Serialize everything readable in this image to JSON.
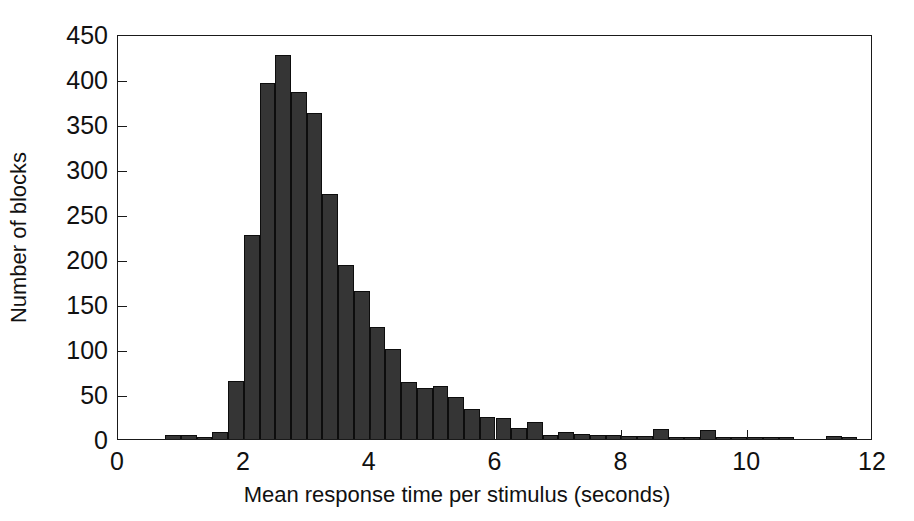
{
  "chart_data": {
    "type": "bar",
    "title": "",
    "subtitle": "",
    "xlabel": "Mean response time per stimulus (seconds)",
    "ylabel": "Number of blocks",
    "xlim": [
      0,
      12
    ],
    "ylim": [
      0,
      450
    ],
    "xticks": [
      0,
      2,
      4,
      6,
      8,
      10,
      12
    ],
    "yticks": [
      0,
      50,
      100,
      150,
      200,
      250,
      300,
      350,
      400,
      450
    ],
    "xtick_labels": [
      "0",
      "2",
      "4",
      "6",
      "8",
      "10",
      "12"
    ],
    "ytick_labels": [
      "0",
      "50",
      "100",
      "150",
      "200",
      "250",
      "300",
      "350",
      "400",
      "450"
    ],
    "grid": false,
    "legend": null,
    "bin_width": 0.25,
    "bar_color": "#353535",
    "bar_edge_color": "#0d0d0d",
    "axis_color": "#1a1a1a",
    "background_color": "#ffffff",
    "bin_starts": [
      0.75,
      1.0,
      1.25,
      1.5,
      1.75,
      2.0,
      2.25,
      2.5,
      2.75,
      3.0,
      3.25,
      3.5,
      3.75,
      4.0,
      4.25,
      4.5,
      4.75,
      5.0,
      5.25,
      5.5,
      5.75,
      6.0,
      6.25,
      6.5,
      6.75,
      7.0,
      7.25,
      7.5,
      7.75,
      8.0,
      8.25,
      8.5,
      8.75,
      9.0,
      9.25,
      9.5,
      9.75,
      10.0,
      10.25,
      10.5,
      11.25,
      11.5
    ],
    "categories": [
      "0.75-1.00",
      "1.00-1.25",
      "1.25-1.50",
      "1.50-1.75",
      "1.75-2.00",
      "2.00-2.25",
      "2.25-2.50",
      "2.50-2.75",
      "2.75-3.00",
      "3.00-3.25",
      "3.25-3.50",
      "3.50-3.75",
      "3.75-4.00",
      "4.00-4.25",
      "4.25-4.50",
      "4.50-4.75",
      "4.75-5.00",
      "5.00-5.25",
      "5.25-5.50",
      "5.50-5.75",
      "5.75-6.00",
      "6.00-6.25",
      "6.25-6.50",
      "6.50-6.75",
      "6.75-7.00",
      "7.00-7.25",
      "7.25-7.50",
      "7.50-7.75",
      "7.75-8.00",
      "8.00-8.25",
      "8.25-8.50",
      "8.50-8.75",
      "8.75-9.00",
      "9.00-9.25",
      "9.25-9.50",
      "9.50-9.75",
      "9.75-10.00",
      "10.00-10.25",
      "10.25-10.50",
      "10.50-10.75",
      "11.25-11.50",
      "11.50-11.75"
    ],
    "values": [
      4,
      4,
      2,
      8,
      64,
      227,
      396,
      427,
      386,
      362,
      272,
      193,
      165,
      124,
      100,
      63,
      57,
      59,
      47,
      33,
      25,
      23,
      12,
      19,
      5,
      8,
      6,
      5,
      4,
      3,
      3,
      11,
      2,
      2,
      10,
      2,
      1,
      1,
      2,
      1,
      3,
      2
    ]
  }
}
